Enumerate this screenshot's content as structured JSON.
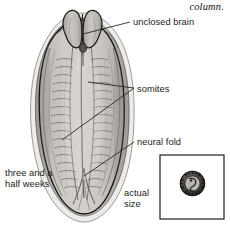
{
  "figure": {
    "caption_fragment": "column.",
    "background_color": "#ffffff",
    "ink_color": "#1d1d1d",
    "embryo_fill": "#c9c6c3",
    "embryo_shadow": "#9b9894",
    "embryo_outline": "#171717"
  },
  "labels": {
    "unclosed_brain": "unclosed brain",
    "somites": "somites",
    "neural_fold": "neural fold",
    "actual_size": "actual size",
    "age": "three\nand\na half\nweeks"
  },
  "inset": {
    "name": "actual-size-box",
    "border_color": "#1d1d1d",
    "specimen": "tiny dark comma-shaped embryo"
  },
  "leaders": [
    {
      "name": "leader-unclosed-brain",
      "from": [
        130,
        22
      ],
      "to": [
        83,
        34
      ]
    },
    {
      "name": "leader-somites-upper",
      "from": [
        134,
        88
      ],
      "to": [
        88,
        82
      ]
    },
    {
      "name": "leader-somites-lower",
      "from": [
        134,
        88
      ],
      "to": [
        62,
        140
      ]
    },
    {
      "name": "leader-neural-fold",
      "from": [
        134,
        142
      ],
      "to": [
        84,
        176
      ]
    }
  ]
}
